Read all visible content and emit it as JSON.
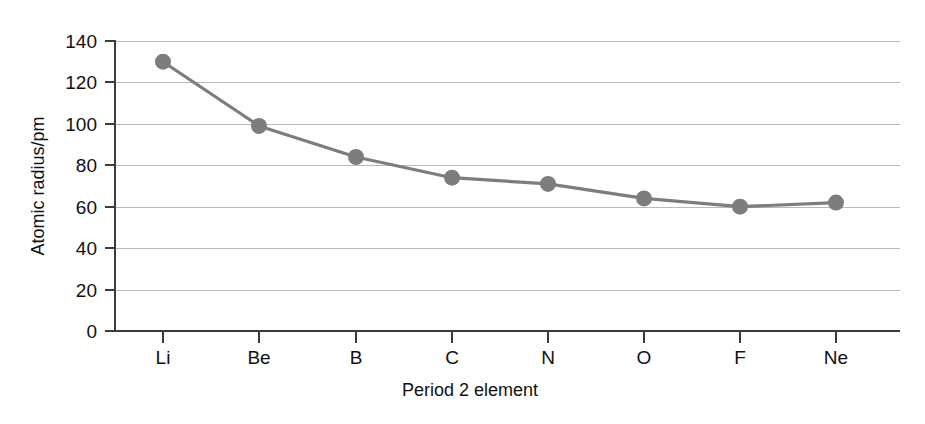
{
  "chart_data": {
    "type": "line",
    "title": "",
    "subtitle": "",
    "xlabel": "Period 2 element",
    "ylabel": "Atomic radius/pm",
    "categories": [
      "Li",
      "Be",
      "B",
      "C",
      "N",
      "O",
      "F",
      "Ne"
    ],
    "values": [
      130,
      99,
      84,
      74,
      71,
      64,
      60,
      62
    ],
    "series": [
      {
        "name": "Atomic radius",
        "values": [
          130,
          99,
          84,
          74,
          71,
          64,
          60,
          62
        ]
      }
    ],
    "ylim": [
      0,
      140
    ],
    "y_ticks": [
      0,
      20,
      40,
      60,
      80,
      100,
      120,
      140
    ],
    "y_tick_labels": [
      "0",
      "20",
      "40",
      "60",
      "80",
      "100",
      "120",
      "140"
    ],
    "x_tick_labels": [
      "Li",
      "Be",
      "B",
      "C",
      "N",
      "O",
      "F",
      "Ne"
    ],
    "grid": true,
    "grid_axis": "y",
    "legend": false,
    "legend_position": "none",
    "marker": "circle",
    "colors": {
      "series": "#7d7d7d",
      "marker": "#7d7d7d",
      "grid": "#b9b9b9",
      "axis": "#3c3c3c",
      "text": "#111111",
      "background": "#ffffff"
    }
  },
  "axes": {
    "y_title": "Atomic radius/pm",
    "x_title": "Period 2 element",
    "y_tick_0": "0",
    "y_tick_1": "20",
    "y_tick_2": "40",
    "y_tick_3": "60",
    "y_tick_4": "80",
    "y_tick_5": "100",
    "y_tick_6": "120",
    "y_tick_7": "140",
    "x_tick_0": "Li",
    "x_tick_1": "Be",
    "x_tick_2": "B",
    "x_tick_3": "C",
    "x_tick_4": "N",
    "x_tick_5": "O",
    "x_tick_6": "F",
    "x_tick_7": "Ne"
  }
}
